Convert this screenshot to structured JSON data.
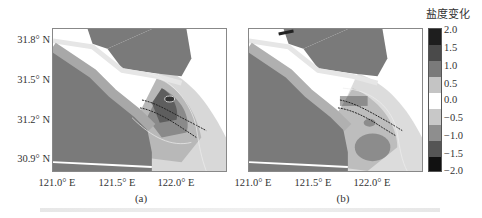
{
  "figure": {
    "colorbar": {
      "title": "盐度变化",
      "ticks": [
        "2.0",
        "1.5",
        "1.0",
        "0.5",
        "0.0",
        "−0.5",
        "−1.0",
        "−1.5",
        "−2.0"
      ],
      "range": [
        -2.0,
        2.0
      ]
    },
    "y_ticks": [
      "31.8° N",
      "31.5° N",
      "31.2° N",
      "30.9° N"
    ],
    "panels": [
      {
        "label": "(a)",
        "x_ticks": [
          "121.0° E",
          "121.5° E",
          "122.0° E"
        ]
      },
      {
        "label": "(b)",
        "x_ticks": [
          "121.0° E",
          "121.5° E",
          "122.0° E"
        ]
      }
    ],
    "colors": {
      "land": "#7a7a7a",
      "positive_dark": "#3a3a3a",
      "zero": "#ffffff",
      "negative_dark": "#1a1a1a"
    }
  }
}
